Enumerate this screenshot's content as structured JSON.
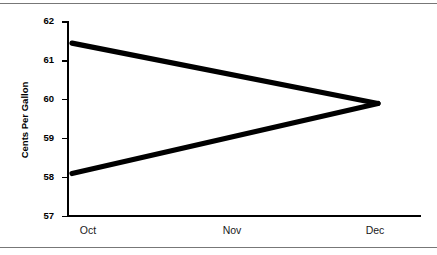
{
  "figure": {
    "background_color": "#ffffff",
    "rule_color": "#777777",
    "line_color": "#000000"
  },
  "chart_data": {
    "type": "line",
    "title": "",
    "subtitle": "",
    "xlabel": "",
    "ylabel": "Cents Per Gallon",
    "categories": [
      "Oct",
      "Nov",
      "Dec"
    ],
    "x_tick_labels": [
      "Oct",
      "Nov",
      "Dec"
    ],
    "y_tick_labels": [
      "57",
      "58",
      "59",
      "60",
      "61",
      "62"
    ],
    "y_tick_values": [
      57,
      58,
      59,
      60,
      61,
      62
    ],
    "ylim": [
      57,
      62
    ],
    "grid": false,
    "legend": false,
    "legend_position": "none",
    "annotations": [],
    "series": [
      {
        "name": "upper",
        "values": [
          61.45,
          60.67,
          59.9
        ]
      },
      {
        "name": "lower",
        "values": [
          58.1,
          59.0,
          59.9
        ]
      }
    ]
  },
  "axes": {
    "y_title": "Cents Per Gallon",
    "y_ticks": [
      {
        "label": "62",
        "value": 62
      },
      {
        "label": "61",
        "value": 61
      },
      {
        "label": "60",
        "value": 60
      },
      {
        "label": "59",
        "value": 59
      },
      {
        "label": "58",
        "value": 58
      },
      {
        "label": "57",
        "value": 57
      }
    ],
    "x_ticks": [
      {
        "label": "Oct",
        "value": 0
      },
      {
        "label": "Nov",
        "value": 1
      },
      {
        "label": "Dec",
        "value": 2
      }
    ]
  }
}
